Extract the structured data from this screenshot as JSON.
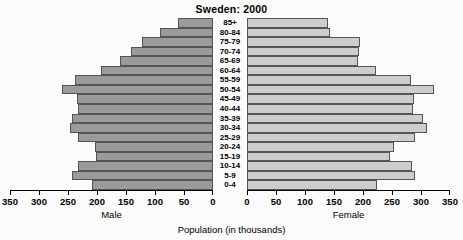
{
  "chart_data": {
    "type": "bar",
    "subtype": "population-pyramid",
    "title": "Sweden: 2000",
    "xlabel": "Population (in thousands)",
    "ylabel": "",
    "grid": false,
    "legend_position": "none",
    "axis_captions": {
      "left": "Male",
      "right": "Female"
    },
    "categories": [
      "85+",
      "80-84",
      "75-79",
      "70-74",
      "65-69",
      "60-64",
      "55-59",
      "50-54",
      "45-49",
      "40-44",
      "35-39",
      "30-34",
      "25-29",
      "20-24",
      "15-19",
      "10-14",
      "5-9",
      "0-4"
    ],
    "xlim_left": [
      350,
      0
    ],
    "xlim_right": [
      0,
      350
    ],
    "xticks_left": [
      350,
      300,
      250,
      200,
      150,
      100,
      50,
      0
    ],
    "xticks_right": [
      0,
      50,
      100,
      150,
      200,
      250,
      300,
      350
    ],
    "axis_max": 350,
    "series": [
      {
        "name": "Male",
        "side": "left",
        "color": "#9a9a9a",
        "values": [
          60,
          92,
          123,
          142,
          161,
          193,
          238,
          260,
          235,
          233,
          243,
          247,
          233,
          203,
          202,
          233,
          243,
          208
        ]
      },
      {
        "name": "Female",
        "side": "right",
        "color": "#cdcdcd",
        "values": [
          140,
          143,
          195,
          193,
          191,
          222,
          283,
          322,
          288,
          286,
          303,
          311,
          289,
          253,
          247,
          285,
          290,
          224
        ]
      }
    ]
  },
  "colors": {
    "male_bar": "#9a9a9a",
    "female_bar": "#cdcdcd",
    "bar_border": "#555555",
    "background": "#fbfbfb",
    "text": "#000000"
  }
}
